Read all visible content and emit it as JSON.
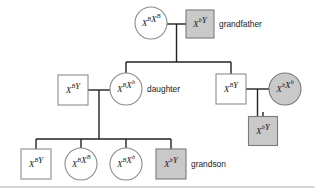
{
  "figure": {
    "type": "pedigree-chart",
    "width": 315,
    "height": 190,
    "background_color": "#ffffff",
    "line_color": "#222222",
    "affected_fill_color": "#c9c9c9",
    "unaffected_fill_color": "#ffffff",
    "shape_stroke_color": "#8c8c8c"
  },
  "legend_keys": {
    "square_meaning": "male",
    "circle_meaning": "female",
    "shaded_meaning": "affected"
  },
  "individuals": [
    {
      "id": "i1",
      "generation": 1,
      "sex": "female",
      "shape": "circle",
      "affected": false,
      "genotype": "XBXB",
      "allele1": "X",
      "allele1_sup": "B",
      "allele2": "X",
      "allele2_sup": "B",
      "role_label": "",
      "cx": 151,
      "cy": 23,
      "r": 16
    },
    {
      "id": "i2",
      "generation": 1,
      "sex": "male",
      "shape": "square",
      "affected": true,
      "genotype": "XbY",
      "allele1": "X",
      "allele1_sup": "b",
      "allele2": "Y",
      "allele2_sup": "",
      "role_label": "grandfather",
      "cx": 200,
      "cy": 24,
      "size": 28
    },
    {
      "id": "i3",
      "generation": 2,
      "sex": "male",
      "shape": "square",
      "affected": false,
      "genotype": "XBY",
      "allele1": "X",
      "allele1_sup": "B",
      "allele2": "Y",
      "allele2_sup": "",
      "role_label": "",
      "cx": 73,
      "cy": 90,
      "size": 30
    },
    {
      "id": "i4",
      "generation": 2,
      "sex": "female",
      "shape": "circle",
      "affected": false,
      "genotype": "XBXb",
      "allele1": "X",
      "allele1_sup": "B",
      "allele2": "X",
      "allele2_sup": "b",
      "role_label": "daughter",
      "cx": 126,
      "cy": 89,
      "r": 16
    },
    {
      "id": "i5",
      "generation": 2,
      "sex": "male",
      "shape": "square",
      "affected": false,
      "genotype": "XBY",
      "allele1": "X",
      "allele1_sup": "B",
      "allele2": "Y",
      "allele2_sup": "",
      "role_label": "",
      "cx": 231,
      "cy": 89,
      "size": 30
    },
    {
      "id": "i6",
      "generation": 2,
      "sex": "female",
      "shape": "circle",
      "affected": true,
      "genotype": "XbXb",
      "allele1": "X",
      "allele1_sup": "b",
      "allele2": "X",
      "allele2_sup": "b",
      "role_label": "",
      "cx": 285,
      "cy": 89,
      "r": 16
    },
    {
      "id": "i7",
      "generation": 3,
      "sex": "male",
      "shape": "square",
      "affected": true,
      "genotype": "XbY",
      "allele1": "X",
      "allele1_sup": "b",
      "allele2": "Y",
      "allele2_sup": "",
      "role_label": "",
      "cx": 263,
      "cy": 131,
      "size": 29
    },
    {
      "id": "i8",
      "generation": 3,
      "sex": "male",
      "shape": "square",
      "affected": false,
      "genotype": "XBY",
      "allele1": "X",
      "allele1_sup": "B",
      "allele2": "Y",
      "allele2_sup": "",
      "role_label": "",
      "cx": 36,
      "cy": 164,
      "size": 30
    },
    {
      "id": "i9",
      "generation": 3,
      "sex": "female",
      "shape": "circle",
      "affected": false,
      "genotype": "XBXB",
      "allele1": "X",
      "allele1_sup": "B",
      "allele2": "X",
      "allele2_sup": "B",
      "role_label": "",
      "cx": 81,
      "cy": 164,
      "r": 16
    },
    {
      "id": "i10",
      "generation": 3,
      "sex": "female",
      "shape": "circle",
      "affected": false,
      "genotype": "XBXb",
      "allele1": "X",
      "allele1_sup": "B",
      "allele2": "X",
      "allele2_sup": "b",
      "role_label": "",
      "cx": 126,
      "cy": 164,
      "r": 16
    },
    {
      "id": "i11",
      "generation": 3,
      "sex": "male",
      "shape": "square",
      "affected": true,
      "genotype": "XbY",
      "allele1": "X",
      "allele1_sup": "b",
      "allele2": "Y",
      "allele2_sup": "",
      "role_label": "grandson",
      "cx": 171,
      "cy": 164,
      "size": 30
    }
  ],
  "role_labels": {
    "grandfather": "grandfather",
    "daughter": "daughter",
    "grandson": "grandson"
  },
  "connectors": [
    {
      "name": "mating-line-gen1",
      "d": "M 167 24 L 186 24"
    },
    {
      "name": "gen1-descent-drop",
      "d": "M 176.5 24 L 176.5 62"
    },
    {
      "name": "gen1-sibship-bar",
      "d": "M 126 62 L 231 62"
    },
    {
      "name": "sib-drop-daughter",
      "d": "M 126 62 L 126 73"
    },
    {
      "name": "sib-drop-son-right",
      "d": "M 231 62 L 231 74"
    },
    {
      "name": "mating-line-gen2-left",
      "d": "M 88 90 L 110 90"
    },
    {
      "name": "gen2-left-descent-drop",
      "d": "M 99 90 L 99 139"
    },
    {
      "name": "gen2-sibship-bar",
      "d": "M 36 139 L 171 139"
    },
    {
      "name": "child-drop-1",
      "d": "M 36 139 L 36 149"
    },
    {
      "name": "child-drop-2",
      "d": "M 81 139 L 81 148"
    },
    {
      "name": "child-drop-3",
      "d": "M 126 139 L 126 148"
    },
    {
      "name": "child-drop-4",
      "d": "M 171 139 L 171 149"
    },
    {
      "name": "mating-line-gen2-right",
      "d": "M 246 89 L 269 89"
    },
    {
      "name": "gen2-right-descent-drop",
      "d": "M 257.5 89 L 257.5 117"
    },
    {
      "name": "gen3-right-child-stub",
      "d": "M 263 112 L 263 117"
    }
  ],
  "frame": {
    "top_line": false,
    "bottom_line": true,
    "bottom_y": 187
  }
}
